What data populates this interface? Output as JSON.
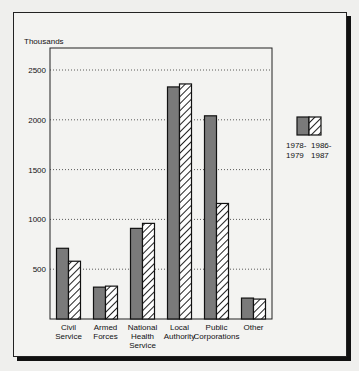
{
  "chart_data": {
    "type": "bar",
    "title": "",
    "ylabel": "Thousands",
    "xlabel": "",
    "ylim": [
      0,
      2700
    ],
    "yticks": [
      500,
      1000,
      1500,
      2000,
      2500
    ],
    "ytick_labels": [
      "500",
      "1000",
      "1500",
      "2000",
      "2500"
    ],
    "grid": "horizontal-dotted",
    "categories": [
      [
        "Civil",
        "Service"
      ],
      [
        "Armed",
        "Forces"
      ],
      [
        "National",
        "Health",
        "Service"
      ],
      [
        "Local",
        "Authority"
      ],
      [
        "Public",
        "Corporations"
      ],
      [
        "Other"
      ]
    ],
    "series": [
      {
        "name": "1978-1979",
        "name_lines": [
          "1978-",
          "1979"
        ],
        "style": "solid",
        "color": "#7a7a7a",
        "values": [
          710,
          320,
          910,
          2330,
          2040,
          210
        ]
      },
      {
        "name": "1986-1987",
        "name_lines": [
          "1986-",
          "1987"
        ],
        "style": "hatched",
        "color": "#ffffff",
        "values": [
          580,
          330,
          960,
          2360,
          1160,
          200
        ]
      }
    ],
    "legend_position": "right"
  }
}
